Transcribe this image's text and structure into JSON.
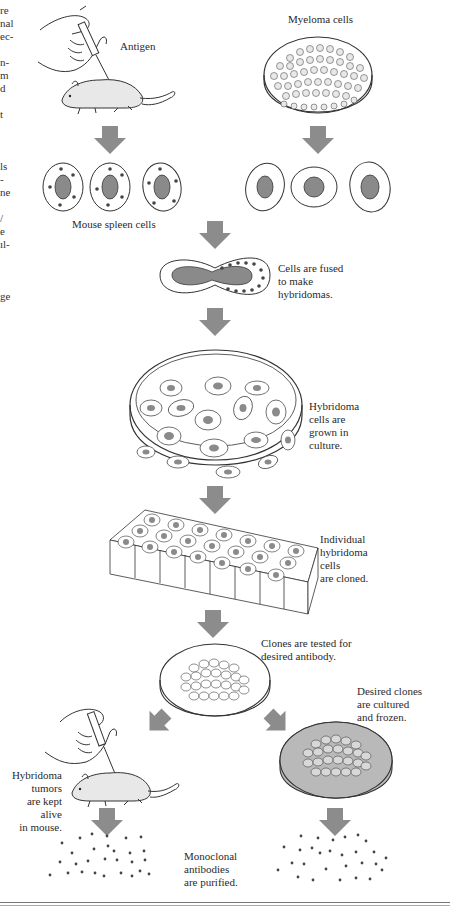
{
  "figure": {
    "topic": "Production of monoclonal antibodies",
    "labels": {
      "antigen": "Antigen",
      "myeloma": "Myeloma cells",
      "spleen": "Mouse spleen cells",
      "fused": "Cells are fused\nto make\nhybridomas.",
      "grown": "Hybridoma\ncells are\ngrown in\nculture.",
      "cloned": "Individual\nhybridoma\ncells\nare cloned.",
      "tested": "Clones are tested for\ndesired antibody.",
      "frozen": "Desired clones\nare cultured\nand frozen.",
      "tumors": "Hybridoma\ntumors\nare kept\nalive\nin mouse.",
      "purified": "Monoclonal\nantibodies\nare purified."
    },
    "left_text_fragments": [
      "re",
      "nal",
      "ec-",
      "",
      "n-",
      "m",
      "d",
      "",
      "t",
      "",
      "",
      "ls",
      "-",
      "ne",
      "",
      "/",
      "e",
      "ıl-",
      "",
      "",
      "ge"
    ],
    "colors": {
      "arrow": "#8c8c8c",
      "nucleus": "#8a8a8a",
      "dish_fill_gray": "#b9b9b9",
      "line": "#333333"
    }
  }
}
